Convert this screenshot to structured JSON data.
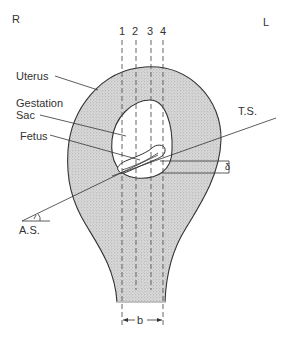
{
  "diagram": {
    "orientation": {
      "right_label": "R",
      "left_label": "L"
    },
    "scan_lines": [
      {
        "label": "1"
      },
      {
        "label": "2"
      },
      {
        "label": "3"
      },
      {
        "label": "4"
      }
    ],
    "labels": {
      "uterus": "Uterus",
      "gestation_sac_line1": "Gestation",
      "gestation_sac_line2": "Sac",
      "fetus": "Fetus",
      "transverse_section": "T.S.",
      "axial_section": "A.S.",
      "width_marker": "b",
      "thickness_marker": "δ"
    },
    "colors": {
      "uterus_fill": "#d4d4d4",
      "outline": "#333333",
      "background": "#ffffff"
    }
  }
}
